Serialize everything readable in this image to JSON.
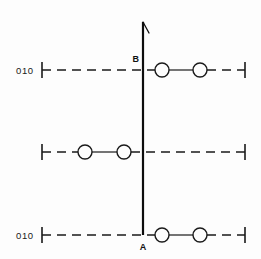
{
  "figure": {
    "title": "",
    "background_color": "#fdfdfd",
    "stroke_color": "#1a1a1a",
    "width": 261,
    "height": 259
  },
  "axis_labels": {
    "top_row": "010",
    "middle_row": "",
    "bottom_row": "010"
  },
  "node_labels": {
    "top_vertical": "B",
    "bottom_vertical": "A"
  },
  "vertical_line": {
    "x": 143,
    "y_top": 22,
    "y_bottom": 235,
    "has_arrow": true,
    "arrow_direction": "up"
  },
  "rows": [
    {
      "id": "row-top",
      "label": "010",
      "y": 70,
      "x_start": 42,
      "x_end": 245,
      "circles": [
        {
          "cx": 162,
          "cy": 70,
          "r": 7
        },
        {
          "cx": 200,
          "cy": 70,
          "r": 7
        }
      ]
    },
    {
      "id": "row-middle",
      "label": "",
      "y": 152,
      "x_start": 42,
      "x_end": 245,
      "circles": [
        {
          "cx": 85,
          "cy": 152,
          "r": 7
        },
        {
          "cx": 124,
          "cy": 152,
          "r": 7
        }
      ]
    },
    {
      "id": "row-bottom",
      "label": "010",
      "y": 235,
      "x_start": 42,
      "x_end": 245,
      "circles": [
        {
          "cx": 162,
          "cy": 235,
          "r": 7
        },
        {
          "cx": 200,
          "cy": 235,
          "r": 7
        }
      ]
    }
  ]
}
